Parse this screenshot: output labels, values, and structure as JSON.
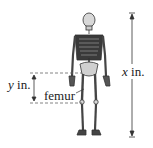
{
  "diagram": {
    "labels": {
      "height_var": "x",
      "height_unit": "in.",
      "femur_var": "y",
      "femur_unit": "in.",
      "bone": "femur"
    },
    "colors": {
      "line": "#555555",
      "dash": "#666666",
      "bone": "#cfcfcf",
      "bone_outline": "#333333",
      "ribcage": "#2e2e2e"
    }
  }
}
